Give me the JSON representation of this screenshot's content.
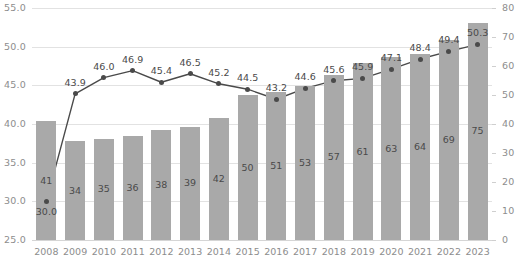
{
  "chart_data": {
    "type": "bar",
    "title": "",
    "subtitle": "",
    "xlabel": "",
    "ylabel": "",
    "categories": [
      "2008",
      "2009",
      "2010",
      "2011",
      "2012",
      "2013",
      "2014",
      "2015",
      "2016",
      "2017",
      "2018",
      "2019",
      "2020",
      "2021",
      "2022",
      "2023"
    ],
    "series": [
      {
        "name": "bars",
        "type": "bar",
        "axis": "right",
        "color": "#a9a9a9",
        "values": [
          41,
          34,
          35,
          36,
          38,
          39,
          42,
          50,
          51,
          53,
          57,
          61,
          63,
          64,
          69,
          75
        ],
        "labels": [
          "41",
          "34",
          "35",
          "36",
          "38",
          "39",
          "42",
          "50",
          "51",
          "53",
          "57",
          "61",
          "63",
          "64",
          "69",
          "75"
        ]
      },
      {
        "name": "line",
        "type": "line",
        "axis": "left",
        "color": "#4a4a4a",
        "values": [
          30.0,
          43.9,
          46.0,
          46.9,
          45.4,
          46.5,
          45.2,
          44.5,
          43.2,
          44.6,
          45.6,
          45.9,
          47.1,
          48.4,
          49.4,
          50.3
        ],
        "labels": [
          "30.0",
          "43.9",
          "46.0",
          "46.9",
          "45.4",
          "46.5",
          "45.2",
          "44.5",
          "43.2",
          "44.6",
          "45.6",
          "45.9",
          "47.1",
          "48.4",
          "49.4",
          "50.3"
        ]
      }
    ],
    "left_axis": {
      "min": 25.0,
      "max": 55.0,
      "step": 5.0,
      "ticks": [
        "25.0",
        "30.0",
        "35.0",
        "40.0",
        "45.0",
        "50.0",
        "55.0"
      ]
    },
    "right_axis": {
      "min": 0,
      "max": 80,
      "step": 10,
      "ticks": [
        "0",
        "10",
        "20",
        "30",
        "40",
        "50",
        "60",
        "70",
        "80"
      ]
    },
    "grid": true,
    "legend": "none"
  }
}
